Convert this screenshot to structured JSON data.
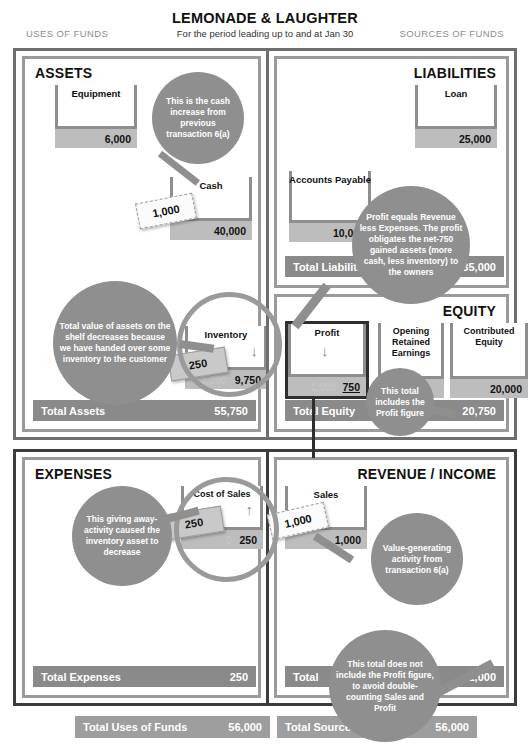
{
  "header": {
    "title": "LEMONADE & LAUGHTER",
    "subtitle": "For the period leading up to and at Jan 30",
    "uses_label": "USES OF FUNDS",
    "sources_label": "SOURCES OF FUNDS"
  },
  "colors": {
    "bubble": "#8f8f8f",
    "total_bar": "#8a8a8a",
    "value_bar": "#bdbdbd",
    "panel_border": "#9a9a9a",
    "frame_border": "#6e6e6e",
    "highlight_border": "#2e2e2e"
  },
  "panels": {
    "assets": {
      "title": "ASSETS",
      "total_label": "Total Assets",
      "total_value": "55,750",
      "accounts": [
        {
          "name": "Equipment",
          "value": "6,000",
          "old_value": "",
          "arrow": ""
        },
        {
          "name": "Cash",
          "value": "40,000",
          "old_value": "",
          "arrow": ""
        },
        {
          "name": "Inventory",
          "value": "9,750",
          "old_value": "10,000",
          "arrow": "down"
        }
      ],
      "notes": [
        {
          "id": "cash-note",
          "value": "1,000",
          "style": "white"
        },
        {
          "id": "inventory-note",
          "value": "250",
          "style": "gray"
        }
      ]
    },
    "liabilities": {
      "title": "LIABILITIES",
      "total_label": "Total Liabilities",
      "total_value": "35,000",
      "accounts": [
        {
          "name": "Loan",
          "value": "25,000",
          "old_value": "",
          "arrow": ""
        },
        {
          "name": "Accounts Payable",
          "value": "10,000",
          "old_value": "",
          "arrow": ""
        }
      ]
    },
    "equity": {
      "title": "EQUITY",
      "total_label": "Total  Equity",
      "total_value": "20,750",
      "accounts": [
        {
          "name": "Profit",
          "value": "750",
          "old_value": "1,000",
          "arrow": "down",
          "highlight": true
        },
        {
          "name": "Opening Retained Earnings",
          "value": "",
          "old_value": "",
          "arrow": ""
        },
        {
          "name": "Contributed Equity",
          "value": "20,000",
          "old_value": "",
          "arrow": ""
        }
      ]
    },
    "expenses": {
      "title": "EXPENSES",
      "total_label": "Total Expenses",
      "total_value": "250",
      "accounts": [
        {
          "name": "Cost of Sales",
          "value": "250",
          "old_value": "0",
          "arrow": "up"
        }
      ],
      "notes": [
        {
          "id": "cos-note",
          "value": "250",
          "style": "gray"
        }
      ]
    },
    "revenue": {
      "title": "REVENUE / INCOME",
      "total_label": "Total",
      "total_value": "1,000",
      "accounts": [
        {
          "name": "Sales",
          "value": "1,000",
          "old_value": "0",
          "arrow": ""
        }
      ],
      "notes": [
        {
          "id": "sales-note",
          "value": "1,000",
          "style": "white"
        }
      ]
    }
  },
  "footer": {
    "uses_label": "Total Uses of Funds",
    "uses_value": "56,000",
    "sources_label": "Total Sources of Funds",
    "sources_value": "56,000"
  },
  "bubbles": {
    "cash_increase": "This is the cash increase from previous transaction 6(a)",
    "inventory_decrease": "Total value of assets on the shelf decreases because we have handed over some inventory to the customer",
    "profit_explains": "Profit equals Revenue less Expenses. The profit obligates the net-750 gained assets (more cash, less inventory) to the owners",
    "equity_total": "This total includes the Profit figure",
    "expense_giveaway": "This giving away-activity caused the inventory asset to decrease",
    "revenue_value": "Value-generating activity from transaction 6(a)",
    "revenue_total": "This total does not include the Profit figure, to avoid double-counting Sales and Profit"
  }
}
